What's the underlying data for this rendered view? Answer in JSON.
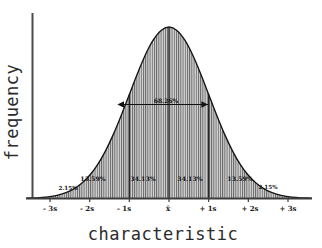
{
  "chart_data": {
    "type": "area",
    "title": "",
    "subtitle": "",
    "xlabel": "characteristic",
    "ylabel": "frequency",
    "grid": false,
    "legend_position": "none",
    "distribution": "normal",
    "xlim": [
      -3.6,
      3.6
    ],
    "ylim": [
      0,
      1
    ],
    "x_tick_labels": [
      "- 3s",
      "- 2s",
      "- 1s",
      "x̄",
      "+ 1s",
      "+ 2s",
      "+ 3s"
    ],
    "x_tick_values": [
      -3,
      -2,
      -1,
      0,
      1,
      2,
      3
    ],
    "y_tick_labels": [],
    "band_labels": [
      "2.15%",
      "13.59%",
      "34.13%",
      "34.13%",
      "13.59%",
      "2.15%"
    ],
    "band_values": [
      2.15,
      13.59,
      34.13,
      34.13,
      13.59,
      2.15
    ],
    "band_ranges": [
      [
        -3,
        -2
      ],
      [
        -2,
        -1
      ],
      [
        -1,
        0
      ],
      [
        0,
        1
      ],
      [
        1,
        2
      ],
      [
        2,
        3
      ]
    ],
    "annotations": [
      {
        "name": "one-sigma-span",
        "label": "68.26%",
        "value": 68.26,
        "from": -1,
        "to": 1,
        "style": "double-arrow"
      }
    ],
    "series": [
      {
        "name": "normal-curve",
        "x": [
          -3.6,
          -3.4,
          -3.2,
          -3.0,
          -2.8,
          -2.6,
          -2.4,
          -2.2,
          -2.0,
          -1.8,
          -1.6,
          -1.4,
          -1.2,
          -1.0,
          -0.8,
          -0.6,
          -0.4,
          -0.2,
          0.0,
          0.2,
          0.4,
          0.6,
          0.8,
          1.0,
          1.2,
          1.4,
          1.6,
          1.8,
          2.0,
          2.2,
          2.4,
          2.6,
          2.8,
          3.0,
          3.2,
          3.4,
          3.6
        ],
        "y": [
          0.0015,
          0.0034,
          0.0056,
          0.0111,
          0.0198,
          0.034,
          0.0561,
          0.0889,
          0.1353,
          0.1979,
          0.278,
          0.3753,
          0.4868,
          0.6065,
          0.7261,
          0.8353,
          0.9231,
          0.9802,
          1.0,
          0.9802,
          0.9231,
          0.8353,
          0.7261,
          0.6065,
          0.4868,
          0.3753,
          0.278,
          0.1979,
          0.1353,
          0.0889,
          0.0561,
          0.034,
          0.0198,
          0.0111,
          0.0056,
          0.0034,
          0.0015
        ]
      }
    ],
    "colors": {
      "curve_stroke": "#1a1a1a",
      "fill_hatch": "#6e6e6e",
      "fill_background": "#d9d9d9",
      "axis": "#4a4a4a",
      "text": "#1a1a1a",
      "page_background": "#ffffff"
    },
    "divider_sigmas": [
      -1,
      0,
      1
    ]
  }
}
